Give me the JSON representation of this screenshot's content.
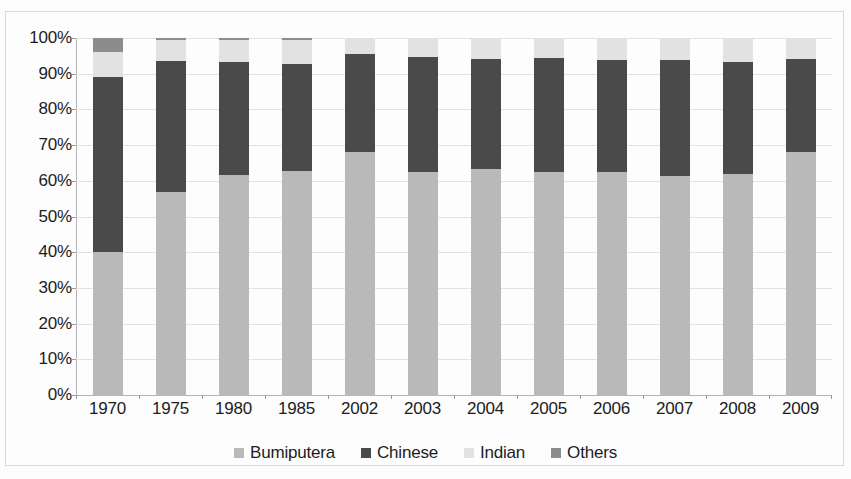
{
  "chart_data": {
    "type": "bar",
    "stacked": true,
    "stack_mode": "percent",
    "title": "",
    "subtitle": "",
    "xlabel": "",
    "ylabel": "",
    "categories": [
      "1970",
      "1975",
      "1980",
      "1985",
      "2002",
      "2003",
      "2004",
      "2005",
      "2006",
      "2007",
      "2008",
      "2009"
    ],
    "series": [
      {
        "name": "Bumiputera",
        "color": "#b9b9b9",
        "values": [
          40.0,
          56.8,
          61.7,
          62.7,
          68.1,
          62.4,
          63.4,
          62.4,
          62.5,
          61.4,
          62.0,
          68.0
        ]
      },
      {
        "name": "Chinese",
        "color": "#4a4a4a",
        "values": [
          49.0,
          36.9,
          31.5,
          30.0,
          27.4,
          32.4,
          30.8,
          32.0,
          31.3,
          32.4,
          31.3,
          26.0
        ]
      },
      {
        "name": "Indian",
        "color": "#e2e2e2",
        "values": [
          7.0,
          5.8,
          6.3,
          6.8,
          4.5,
          5.2,
          5.8,
          5.6,
          6.2,
          6.2,
          6.7,
          6.0
        ]
      },
      {
        "name": "Others",
        "color": "#8c8c8c",
        "values": [
          4.0,
          0.5,
          0.5,
          0.5,
          0.0,
          0.0,
          0.0,
          0.0,
          0.0,
          0.0,
          0.0,
          0.0
        ]
      }
    ],
    "y_ticks": [
      "0%",
      "10%",
      "20%",
      "30%",
      "40%",
      "50%",
      "60%",
      "70%",
      "80%",
      "90%",
      "100%"
    ],
    "y_tick_values": [
      0,
      10,
      20,
      30,
      40,
      50,
      60,
      70,
      80,
      90,
      100
    ],
    "ylim": [
      0,
      100
    ],
    "grid": true,
    "legend_position": "bottom",
    "legend": [
      "Bumiputera",
      "Chinese",
      "Indian",
      "Others"
    ]
  },
  "colors": {
    "background": "#fdfdfd",
    "gridline": "#e3e3e3",
    "axis": "#b5b5b5",
    "text": "#1c1c1c",
    "border": "#d8d8d8"
  }
}
